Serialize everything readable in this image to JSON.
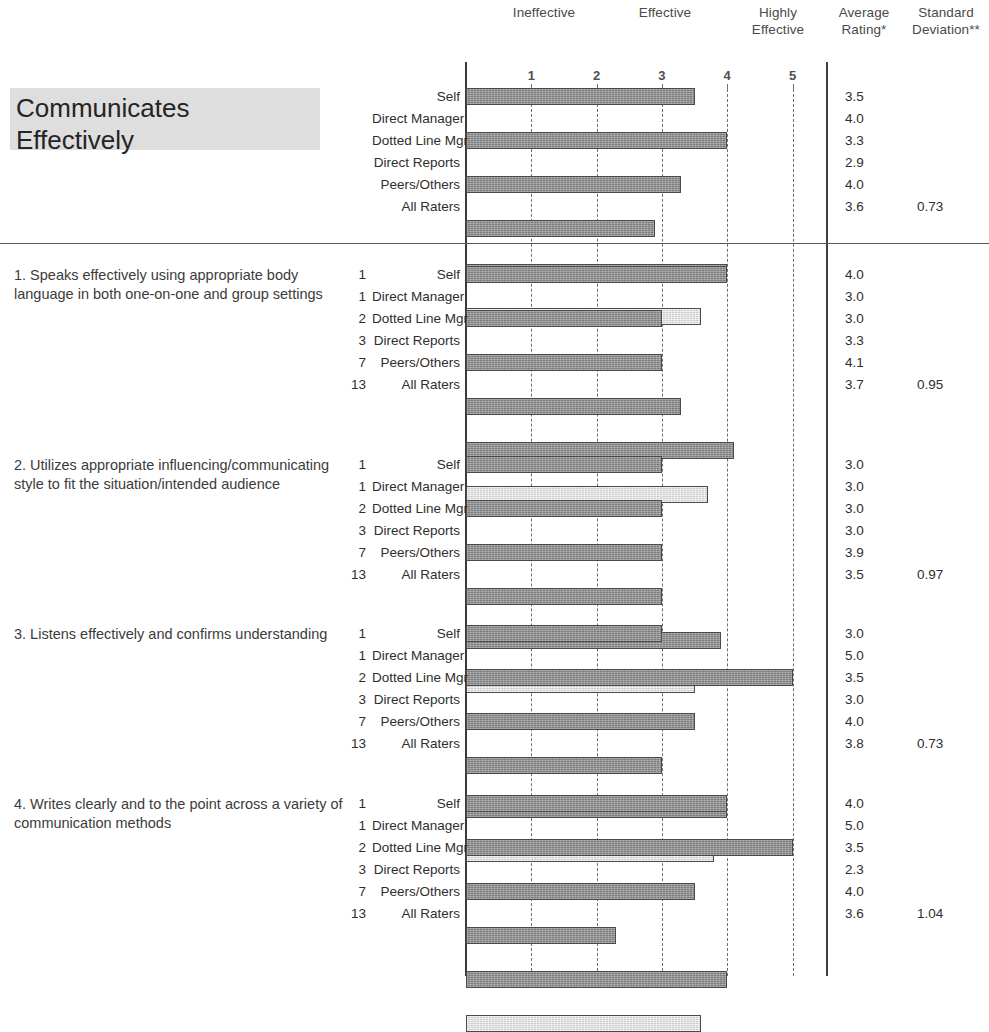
{
  "header": {
    "scale_labels": [
      {
        "text": "Ineffective",
        "x": 489,
        "y": 5
      },
      {
        "text": "Effective",
        "x": 625,
        "y": 5
      },
      {
        "text": "Highly\nEffective",
        "x": 748,
        "y": 5
      },
      {
        "text": "Average\nRating*",
        "x": 834,
        "y": 5
      },
      {
        "text": "Standard\nDeviation**",
        "x": 907,
        "y": 5
      }
    ],
    "ineffective_label": "Ineffective",
    "effective_label": "Effective",
    "highly_effective_label": "Highly Effective",
    "highly_effective_line1": "Highly",
    "highly_effective_line2": "Effective",
    "average_rating_line1": "Average",
    "average_rating_line2": "Rating*",
    "standard_deviation_line1": "Standard",
    "standard_deviation_line2": "Deviation**",
    "ticks": [
      "1",
      "2",
      "3",
      "4",
      "5"
    ]
  },
  "competency": {
    "title_line1": "Communicates",
    "title_line2": "Effectively"
  },
  "chart_data": {
    "type": "bar",
    "xlabel": "",
    "ylabel": "",
    "xlim": [
      0,
      5
    ],
    "grid": true,
    "orientation": "horizontal",
    "tick_labels": [
      "1",
      "2",
      "3",
      "4",
      "5"
    ],
    "axis_anchor_labels": [
      "Ineffective",
      "Effective",
      "Highly Effective"
    ],
    "value_columns": [
      "Average Rating*",
      "Standard Deviation**"
    ],
    "sections": [
      {
        "id": "competency",
        "title": "Communicates Effectively",
        "is_competency": true,
        "std_dev": "0.73",
        "categories": [
          "Self",
          "Direct Manager",
          "Dotted Line Mgr",
          "Direct Reports",
          "Peers/Others",
          "All Raters"
        ],
        "counts": [
          "",
          "",
          "",
          "",
          "",
          ""
        ],
        "values": [
          3.5,
          4.0,
          3.3,
          2.9,
          4.0,
          3.6
        ],
        "value_labels": [
          "3.5",
          "4.0",
          "3.3",
          "2.9",
          "4.0",
          "3.6"
        ]
      },
      {
        "id": "q1",
        "title": "1. Speaks effectively using appropriate body language in both one-on-one and group settings",
        "is_competency": false,
        "std_dev": "0.95",
        "categories": [
          "Self",
          "Direct Manager",
          "Dotted Line Mgr",
          "Direct Reports",
          "Peers/Others",
          "All Raters"
        ],
        "counts": [
          "1",
          "1",
          "2",
          "3",
          "7",
          "13"
        ],
        "values": [
          4.0,
          3.0,
          3.0,
          3.3,
          4.1,
          3.7
        ],
        "value_labels": [
          "4.0",
          "3.0",
          "3.0",
          "3.3",
          "4.1",
          "3.7"
        ]
      },
      {
        "id": "q2",
        "title": "2. Utilizes appropriate influencing/communicating style to fit the situation/intended audience",
        "is_competency": false,
        "std_dev": "0.97",
        "categories": [
          "Self",
          "Direct Manager",
          "Dotted Line Mgr",
          "Direct Reports",
          "Peers/Others",
          "All Raters"
        ],
        "counts": [
          "1",
          "1",
          "2",
          "3",
          "7",
          "13"
        ],
        "values": [
          3.0,
          3.0,
          3.0,
          3.0,
          3.9,
          3.5
        ],
        "value_labels": [
          "3.0",
          "3.0",
          "3.0",
          "3.0",
          "3.9",
          "3.5"
        ]
      },
      {
        "id": "q3",
        "title": "3. Listens effectively and confirms understanding",
        "is_competency": false,
        "std_dev": "0.73",
        "categories": [
          "Self",
          "Direct Manager",
          "Dotted Line Mgr",
          "Direct Reports",
          "Peers/Others",
          "All Raters"
        ],
        "counts": [
          "1",
          "1",
          "2",
          "3",
          "7",
          "13"
        ],
        "values": [
          3.0,
          5.0,
          3.5,
          3.0,
          4.0,
          3.8
        ],
        "value_labels": [
          "3.0",
          "5.0",
          "3.5",
          "3.0",
          "4.0",
          "3.8"
        ]
      },
      {
        "id": "q4",
        "title": "4. Writes clearly and to the point across a variety of communication methods",
        "is_competency": false,
        "std_dev": "1.04",
        "categories": [
          "Self",
          "Direct Manager",
          "Dotted Line Mgr",
          "Direct Reports",
          "Peers/Others",
          "All Raters"
        ],
        "counts": [
          "1",
          "1",
          "2",
          "3",
          "7",
          "13"
        ],
        "values": [
          4.0,
          5.0,
          3.5,
          2.3,
          4.0,
          3.6
        ],
        "value_labels": [
          "4.0",
          "5.0",
          "3.5",
          "2.3",
          "4.0",
          "3.6"
        ]
      }
    ]
  },
  "layout": {
    "axis_x0": 466,
    "unit_px": 65.3,
    "divider_x": 826,
    "section_tops": [
      88,
      266,
      456,
      625,
      795
    ],
    "row_pitch": 22,
    "bar_height": 17,
    "hrule_y": 243
  }
}
